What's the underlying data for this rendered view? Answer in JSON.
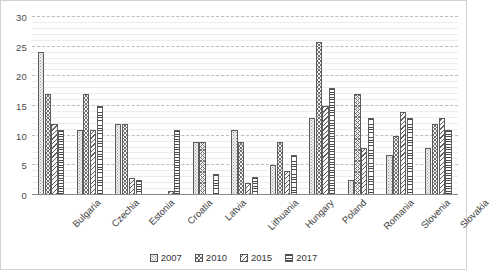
{
  "chart_data": {
    "type": "bar",
    "title": "",
    "xlabel": "",
    "ylabel": "",
    "ylim": [
      0,
      30
    ],
    "yticks": [
      0,
      5,
      10,
      15,
      20,
      25,
      30
    ],
    "grid": true,
    "minor_grid_step": 1,
    "major_grid_step": 5,
    "legend_position": "bottom",
    "categories": [
      "Bulgaria",
      "Czechia",
      "Estonia",
      "Croatia",
      "Latvia",
      "Lithuania",
      "Hungary",
      "Poland",
      "Romania",
      "Slovenia",
      "Slovakia"
    ],
    "series": [
      {
        "name": "2007",
        "pattern": "dotted",
        "values": [
          24.1,
          11.0,
          12.0,
          0.0,
          9.0,
          11.0,
          5.0,
          13.0,
          2.6,
          6.8,
          8.0
        ]
      },
      {
        "name": "2010",
        "pattern": "cross-hatch",
        "values": [
          17.0,
          17.0,
          12.0,
          0.0,
          9.0,
          9.0,
          9.0,
          25.8,
          17.0,
          10.0,
          12.0
        ]
      },
      {
        "name": "2015",
        "pattern": "diagonal-stripes",
        "values": [
          12.0,
          11.0,
          2.8,
          0.6,
          0.0,
          2.1,
          4.0,
          15.0,
          8.0,
          14.0,
          13.0
        ]
      },
      {
        "name": "2017",
        "pattern": "horizontal-stripes",
        "values": [
          11.0,
          15.0,
          2.6,
          11.0,
          3.6,
          3.0,
          6.8,
          18.0,
          13.0,
          13.0,
          11.0
        ]
      }
    ]
  },
  "legend": {
    "items": [
      {
        "label": "2007"
      },
      {
        "label": "2010"
      },
      {
        "label": "2015"
      },
      {
        "label": "2017"
      }
    ]
  },
  "colors": {
    "axis": "#8a8a8a",
    "major_gridline": "#bdbdbd",
    "minor_gridline": "#ececec",
    "bar_outline": "#5d5d5d",
    "text": "#3d3d3d",
    "frame": "#d2d2d2"
  }
}
